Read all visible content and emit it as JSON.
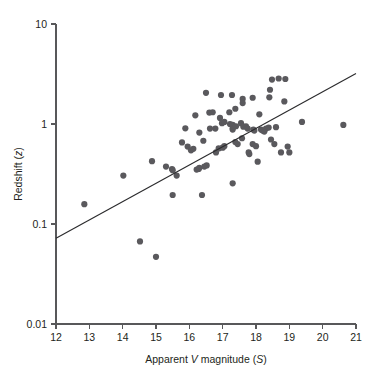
{
  "chart_data": {
    "type": "scatter",
    "title": "",
    "xlabel": "Apparent V magnitude (S)",
    "xlabel_parts": [
      "Apparent ",
      "V",
      " magnitude (",
      "S",
      ")"
    ],
    "ylabel": "Redshift (z)",
    "ylabel_parts": [
      "Redshift (",
      "z",
      ")"
    ],
    "xscale": "linear",
    "yscale": "log",
    "xlim": [
      12,
      21
    ],
    "ylim": [
      0.01,
      10
    ],
    "grid": false,
    "legend": null,
    "xticks": [
      12,
      13,
      14,
      15,
      16,
      17,
      18,
      19,
      20,
      21
    ],
    "xtick_labels": [
      "12",
      "13",
      "14",
      "15",
      "16",
      "17",
      "18",
      "19",
      "20",
      "21"
    ],
    "yticks": [
      0.01,
      0.1,
      1,
      10
    ],
    "ytick_labels": [
      "0.01",
      "0.1",
      "1",
      "10"
    ],
    "marker": "filled-circle",
    "marker_color": "#5a595d",
    "marker_size_px": 3.1,
    "fit_line": {
      "label": "regression line",
      "color": "#2b2b2d",
      "x0": 12.0,
      "y0": 0.072,
      "x1": 21.0,
      "y1": 3.2
    },
    "points": [
      [
        12.85,
        0.158
      ],
      [
        14.02,
        0.305
      ],
      [
        14.52,
        0.067
      ],
      [
        15.0,
        0.047
      ],
      [
        14.88,
        0.425
      ],
      [
        15.3,
        0.375
      ],
      [
        15.48,
        0.355
      ],
      [
        15.5,
        0.345
      ],
      [
        15.5,
        0.195
      ],
      [
        15.62,
        0.305
      ],
      [
        15.88,
        0.905
      ],
      [
        15.78,
        0.655
      ],
      [
        15.95,
        0.595
      ],
      [
        16.05,
        0.545
      ],
      [
        16.18,
        1.22
      ],
      [
        16.12,
        0.565
      ],
      [
        16.22,
        0.35
      ],
      [
        16.28,
        0.355
      ],
      [
        16.3,
        0.365
      ],
      [
        16.3,
        0.82
      ],
      [
        16.38,
        0.195
      ],
      [
        16.42,
        0.68
      ],
      [
        16.5,
        2.05
      ],
      [
        16.45,
        0.375
      ],
      [
        16.52,
        0.385
      ],
      [
        16.6,
        1.3
      ],
      [
        16.7,
        1.31
      ],
      [
        16.62,
        0.9
      ],
      [
        16.78,
        0.9
      ],
      [
        16.8,
        0.52
      ],
      [
        16.88,
        0.57
      ],
      [
        16.95,
        1.95
      ],
      [
        16.92,
        1.15
      ],
      [
        16.98,
        1.02
      ],
      [
        17.05,
        1.05
      ],
      [
        17.0,
        0.58
      ],
      [
        17.05,
        0.6
      ],
      [
        17.2,
        1.31
      ],
      [
        17.28,
        1.95
      ],
      [
        17.22,
        1.0
      ],
      [
        17.3,
        0.98
      ],
      [
        17.3,
        0.91
      ],
      [
        17.3,
        0.88
      ],
      [
        17.38,
        1.42
      ],
      [
        17.4,
        0.95
      ],
      [
        17.38,
        0.66
      ],
      [
        17.45,
        0.63
      ],
      [
        17.3,
        0.255
      ],
      [
        17.55,
        1.02
      ],
      [
        17.6,
        1.78
      ],
      [
        17.6,
        1.62
      ],
      [
        17.62,
        0.94
      ],
      [
        17.58,
        0.72
      ],
      [
        17.7,
        0.95
      ],
      [
        17.75,
        0.9
      ],
      [
        17.78,
        0.52
      ],
      [
        17.8,
        0.5
      ],
      [
        17.9,
        1.83
      ],
      [
        17.92,
        0.88
      ],
      [
        17.95,
        0.86
      ],
      [
        17.9,
        0.63
      ],
      [
        18.0,
        0.6
      ],
      [
        18.05,
        0.42
      ],
      [
        18.1,
        1.25
      ],
      [
        18.15,
        0.88
      ],
      [
        18.2,
        0.86
      ],
      [
        18.25,
        0.84
      ],
      [
        18.3,
        0.9
      ],
      [
        18.38,
        0.92
      ],
      [
        18.42,
        2.2
      ],
      [
        18.48,
        2.78
      ],
      [
        18.4,
        1.85
      ],
      [
        18.45,
        0.7
      ],
      [
        18.55,
        0.63
      ],
      [
        18.6,
        0.93
      ],
      [
        18.68,
        2.85
      ],
      [
        18.88,
        2.82
      ],
      [
        18.85,
        1.68
      ],
      [
        18.75,
        0.52
      ],
      [
        18.95,
        0.595
      ],
      [
        19.0,
        0.52
      ],
      [
        19.38,
        1.05
      ],
      [
        20.62,
        0.98
      ]
    ]
  }
}
